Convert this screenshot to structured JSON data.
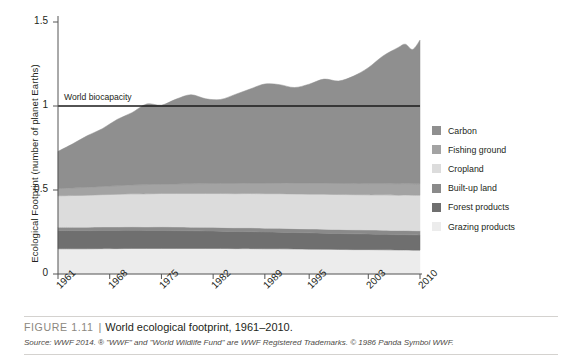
{
  "figure": {
    "number": "FIGURE 1.11",
    "separator": "|",
    "title": "World ecological footprint, 1961–2010.",
    "source": "Source: WWF 2014. ® \"WWF\" and \"World Wildlife Fund\" are WWF Registered Trademarks. © 1986 Panda Symbol WWF."
  },
  "annotations": {
    "biocapacity_label": "World biocapacity"
  },
  "legend": {
    "items": [
      {
        "label": "Carbon",
        "color": "#8f8f8f"
      },
      {
        "label": "Fishing ground",
        "color": "#a3a3a3"
      },
      {
        "label": "Cropland",
        "color": "#dcdcdc"
      },
      {
        "label": "Built-up land",
        "color": "#8a8a8a"
      },
      {
        "label": "Forest products",
        "color": "#6f6f6f"
      },
      {
        "label": "Grazing products",
        "color": "#ececec"
      }
    ]
  },
  "chart_data": {
    "type": "area",
    "stacked": true,
    "title": "World ecological footprint, 1961–2010",
    "xlabel": "",
    "ylabel": "Ecological Footprint (number of planet Earths)",
    "xlim": [
      1961,
      2010
    ],
    "ylim": [
      0,
      1.5
    ],
    "yticks": [
      0,
      0.5,
      1,
      1.5
    ],
    "ytick_labels": [
      "0",
      "0.5",
      "1",
      "1.5"
    ],
    "xticks": [
      1961,
      1968,
      1975,
      1982,
      1989,
      1995,
      2003,
      2010
    ],
    "xtick_labels": [
      "1961",
      "1968",
      "1975",
      "1982",
      "1989",
      "1995",
      "2003",
      "2010"
    ],
    "grid": false,
    "legend_position": "right",
    "x": [
      1961,
      1963,
      1965,
      1967,
      1969,
      1971,
      1973,
      1975,
      1977,
      1979,
      1981,
      1983,
      1985,
      1987,
      1989,
      1991,
      1993,
      1995,
      1997,
      1999,
      2001,
      2003,
      2005,
      2007,
      2008,
      2009,
      2010
    ],
    "series": [
      {
        "name": "Grazing products",
        "color": "#ececec",
        "values": [
          0.15,
          0.15,
          0.15,
          0.151,
          0.151,
          0.152,
          0.152,
          0.152,
          0.152,
          0.152,
          0.152,
          0.152,
          0.151,
          0.151,
          0.15,
          0.15,
          0.149,
          0.148,
          0.147,
          0.146,
          0.145,
          0.145,
          0.144,
          0.143,
          0.143,
          0.142,
          0.142
        ]
      },
      {
        "name": "Forest products",
        "color": "#6f6f6f",
        "values": [
          0.108,
          0.108,
          0.108,
          0.108,
          0.108,
          0.108,
          0.107,
          0.107,
          0.106,
          0.105,
          0.104,
          0.103,
          0.102,
          0.101,
          0.1,
          0.099,
          0.098,
          0.097,
          0.096,
          0.095,
          0.094,
          0.093,
          0.092,
          0.091,
          0.091,
          0.091,
          0.09
        ]
      },
      {
        "name": "Built-up land",
        "color": "#8a8a8a",
        "values": [
          0.021,
          0.021,
          0.021,
          0.021,
          0.021,
          0.021,
          0.021,
          0.022,
          0.022,
          0.022,
          0.022,
          0.022,
          0.022,
          0.023,
          0.023,
          0.023,
          0.023,
          0.023,
          0.024,
          0.024,
          0.024,
          0.024,
          0.025,
          0.025,
          0.025,
          0.025,
          0.025
        ]
      },
      {
        "name": "Cropland",
        "color": "#dcdcdc",
        "values": [
          0.186,
          0.188,
          0.19,
          0.192,
          0.194,
          0.196,
          0.197,
          0.198,
          0.199,
          0.2,
          0.201,
          0.202,
          0.203,
          0.204,
          0.205,
          0.206,
          0.206,
          0.207,
          0.208,
          0.208,
          0.209,
          0.209,
          0.21,
          0.21,
          0.211,
          0.211,
          0.212
        ]
      },
      {
        "name": "Fishing ground",
        "color": "#a3a3a3",
        "values": [
          0.043,
          0.045,
          0.047,
          0.049,
          0.051,
          0.053,
          0.055,
          0.056,
          0.057,
          0.058,
          0.059,
          0.06,
          0.061,
          0.062,
          0.063,
          0.064,
          0.064,
          0.065,
          0.065,
          0.066,
          0.066,
          0.067,
          0.067,
          0.068,
          0.068,
          0.068,
          0.068
        ]
      },
      {
        "name": "Carbon",
        "color": "#8f8f8f",
        "values": [
          0.222,
          0.263,
          0.308,
          0.344,
          0.395,
          0.43,
          0.48,
          0.47,
          0.505,
          0.53,
          0.505,
          0.5,
          0.53,
          0.56,
          0.59,
          0.585,
          0.57,
          0.59,
          0.62,
          0.61,
          0.64,
          0.69,
          0.76,
          0.81,
          0.83,
          0.8,
          0.855
        ]
      }
    ],
    "reference_line": {
      "label": "World biocapacity",
      "value": 1.0,
      "color": "#1a1a1a"
    }
  }
}
